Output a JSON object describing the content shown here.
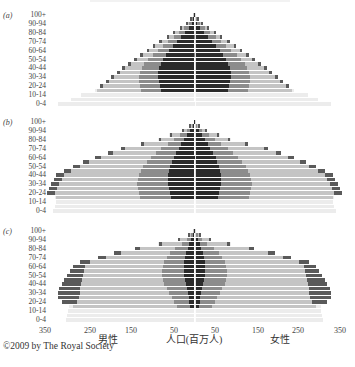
{
  "chart_data": {
    "type": "bar",
    "subtype": "population-pyramid",
    "title": "",
    "xlabel": "人口(百万人)",
    "left_label": "男性",
    "right_label": "女性",
    "x_ticks": [
      "350",
      "250",
      "150",
      "50",
      "50",
      "150",
      "250",
      "350"
    ],
    "x_tick_values": [
      -350,
      -250,
      -150,
      -50,
      50,
      150,
      250,
      350
    ],
    "xlim": [
      -350,
      350
    ],
    "age_tick_labels": [
      "100+",
      "90-94",
      "80-84",
      "70-74",
      "60-64",
      "50-54",
      "40-44",
      "30-34",
      "20-24",
      "10-14",
      "0-4"
    ],
    "age_groups": [
      "100+",
      "95-99",
      "90-94",
      "85-89",
      "80-84",
      "75-79",
      "70-74",
      "65-69",
      "60-64",
      "55-59",
      "50-54",
      "45-49",
      "40-44",
      "35-39",
      "30-34",
      "25-29",
      "20-24",
      "15-19",
      "10-14",
      "5-9",
      "0-4"
    ],
    "layers": [
      "darkest (innermost)",
      "mid gray",
      "light gray",
      "lightest",
      "dark outer cap"
    ],
    "layer_colors": [
      "#2b2b2b",
      "#8c8c8c",
      "#c4c4c4",
      "#ececec",
      "#5a5a5a"
    ],
    "units": "millions",
    "grid": false,
    "legend": "none",
    "panels": [
      {
        "label": "(a)",
        "rows": [
          {
            "age": "100+",
            "l": [
              1,
              2,
              3,
              3
            ],
            "cap": 0
          },
          {
            "age": "95-99",
            "l": [
              3,
              6,
              9,
              9
            ],
            "cap": 1
          },
          {
            "age": "90-94",
            "l": [
              7,
              13,
              19,
              20
            ],
            "cap": 3
          },
          {
            "age": "85-89",
            "l": [
              14,
              24,
              33,
              35
            ],
            "cap": 4
          },
          {
            "age": "80-84",
            "l": [
              22,
              36,
              48,
              50
            ],
            "cap": 5
          },
          {
            "age": "75-79",
            "l": [
              32,
              50,
              64,
              66
            ],
            "cap": 5
          },
          {
            "age": "70-74",
            "l": [
              42,
              64,
              80,
              82
            ],
            "cap": 6
          },
          {
            "age": "65-69",
            "l": [
              52,
              76,
              96,
              98
            ],
            "cap": 6
          },
          {
            "age": "60-64",
            "l": [
              60,
              88,
              110,
              112
            ],
            "cap": 6
          },
          {
            "age": "55-59",
            "l": [
              68,
              100,
              124,
              126
            ],
            "cap": 7
          },
          {
            "age": "50-54",
            "l": [
              76,
              110,
              140,
              142
            ],
            "cap": 7
          },
          {
            "age": "45-49",
            "l": [
              80,
              120,
              154,
              156
            ],
            "cap": 7
          },
          {
            "age": "40-44",
            "l": [
              84,
              126,
              168,
              170
            ],
            "cap": 8
          },
          {
            "age": "35-39",
            "l": [
              86,
              130,
              180,
              182
            ],
            "cap": 8
          },
          {
            "age": "30-34",
            "l": [
              86,
              132,
              194,
              196
            ],
            "cap": 8
          },
          {
            "age": "25-29",
            "l": [
              84,
              132,
              206,
              208
            ],
            "cap": 8
          },
          {
            "age": "20-24",
            "l": [
              82,
              130,
              220,
              222
            ],
            "cap": 8
          },
          {
            "age": "15-19",
            "l": [
              80,
              128,
              232,
              236
            ],
            "cap": 0
          },
          {
            "age": "10-14",
            "l": [
              0,
              0,
              0,
              270
            ],
            "cap": 0
          },
          {
            "age": "5-9",
            "l": [
              0,
              0,
              0,
              295
            ],
            "cap": 0
          },
          {
            "age": "0-4",
            "l": [
              0,
              0,
              0,
              325
            ],
            "cap": 0
          }
        ]
      },
      {
        "label": "(b)",
        "rows": [
          {
            "age": "100+",
            "l": [
              1,
              1,
              2,
              2
            ],
            "cap": 0
          },
          {
            "age": "95-99",
            "l": [
              4,
              7,
              10,
              10
            ],
            "cap": 1
          },
          {
            "age": "90-94",
            "l": [
              10,
              18,
              28,
              30
            ],
            "cap": 3
          },
          {
            "age": "85-89",
            "l": [
              18,
              34,
              56,
              60
            ],
            "cap": 5
          },
          {
            "age": "80-84",
            "l": [
              26,
              48,
              82,
              88
            ],
            "cap": 6
          },
          {
            "age": "75-79",
            "l": [
              32,
              64,
              122,
              128
            ],
            "cap": 8
          },
          {
            "age": "70-74",
            "l": [
              38,
              80,
              168,
              176
            ],
            "cap": 10
          },
          {
            "age": "65-69",
            "l": [
              44,
              92,
              196,
              204
            ],
            "cap": 12
          },
          {
            "age": "60-64",
            "l": [
              50,
              104,
              226,
              234
            ],
            "cap": 14
          },
          {
            "age": "55-59",
            "l": [
              54,
              114,
              254,
              262
            ],
            "cap": 15
          },
          {
            "age": "50-54",
            "l": [
              58,
              122,
              276,
              284
            ],
            "cap": 16
          },
          {
            "age": "45-49",
            "l": [
              60,
              128,
              296,
              304
            ],
            "cap": 18
          },
          {
            "age": "40-44",
            "l": [
              62,
              132,
              312,
              318
            ],
            "cap": 20
          },
          {
            "age": "35-39",
            "l": [
              62,
              134,
              318,
              324
            ],
            "cap": 20
          },
          {
            "age": "30-34",
            "l": [
              62,
              136,
              324,
              330
            ],
            "cap": 20
          },
          {
            "age": "25-29",
            "l": [
              60,
              134,
              330,
              334
            ],
            "cap": 18
          },
          {
            "age": "20-24",
            "l": [
              58,
              132,
              334,
              338
            ],
            "cap": 20
          },
          {
            "age": "15-19",
            "l": [
              56,
              130,
              330,
              332
            ],
            "cap": 0
          },
          {
            "age": "10-14",
            "l": [
              0,
              0,
              0,
              330
            ],
            "cap": 0
          },
          {
            "age": "5-9",
            "l": [
              0,
              0,
              0,
              332
            ],
            "cap": 0
          },
          {
            "age": "0-4",
            "l": [
              0,
              0,
              0,
              338
            ],
            "cap": 0
          }
        ]
      },
      {
        "label": "(c)",
        "rows": [
          {
            "age": "100+",
            "l": [
              1,
              2,
              3,
              3
            ],
            "cap": 0
          },
          {
            "age": "95-99",
            "l": [
              4,
              8,
              14,
              14
            ],
            "cap": 2
          },
          {
            "age": "90-94",
            "l": [
              8,
              18,
              36,
              40
            ],
            "cap": 5
          },
          {
            "age": "85-89",
            "l": [
              12,
              30,
              80,
              86
            ],
            "cap": 8
          },
          {
            "age": "80-84",
            "l": [
              16,
              46,
              132,
              140
            ],
            "cap": 12
          },
          {
            "age": "75-79",
            "l": [
              20,
              58,
              178,
              188
            ],
            "cap": 16
          },
          {
            "age": "70-74",
            "l": [
              22,
              66,
              214,
              224
            ],
            "cap": 18
          },
          {
            "age": "65-69",
            "l": [
              24,
              72,
              252,
              262
            ],
            "cap": 22
          },
          {
            "age": "60-64",
            "l": [
              26,
              76,
              262,
              272
            ],
            "cap": 30
          },
          {
            "age": "55-59",
            "l": [
              26,
              78,
              266,
              276
            ],
            "cap": 34
          },
          {
            "age": "50-54",
            "l": [
              24,
              78,
              268,
              278
            ],
            "cap": 38
          },
          {
            "age": "45-49",
            "l": [
              22,
              76,
              270,
              280
            ],
            "cap": 42
          },
          {
            "age": "40-44",
            "l": [
              20,
              72,
              272,
              282
            ],
            "cap": 46
          },
          {
            "age": "35-39",
            "l": [
              18,
              66,
              274,
              284
            ],
            "cap": 50
          },
          {
            "age": "30-34",
            "l": [
              16,
              60,
              276,
              286
            ],
            "cap": 52
          },
          {
            "age": "25-29",
            "l": [
              14,
              54,
              278,
              288
            ],
            "cap": 50
          },
          {
            "age": "20-24",
            "l": [
              12,
              48,
              282,
              292
            ],
            "cap": 36
          },
          {
            "age": "15-19",
            "l": [
              10,
              42,
              290,
              300
            ],
            "cap": 0
          },
          {
            "age": "10-14",
            "l": [
              0,
              0,
              0,
              302
            ],
            "cap": 0
          },
          {
            "age": "5-9",
            "l": [
              0,
              0,
              0,
              304
            ],
            "cap": 0
          },
          {
            "age": "0-4",
            "l": [
              0,
              0,
              0,
              306
            ],
            "cap": 0
          }
        ]
      }
    ]
  },
  "axis": {
    "ticks": [
      "350",
      "250",
      "150",
      "50",
      "50",
      "150",
      "250",
      "350"
    ],
    "male_label": "男性",
    "center_label": "人口(百万人)",
    "female_label": "女性"
  },
  "panels": [
    {
      "label": "(a)",
      "ages": [
        "100+",
        "90-94",
        "80-84",
        "70-74",
        "60-64",
        "50-54",
        "40-44",
        "30-34",
        "20-24",
        "10-14",
        "0-4"
      ]
    },
    {
      "label": "(b)",
      "ages": [
        "100+",
        "90-94",
        "80-84",
        "70-74",
        "60-64",
        "50-54",
        "40-44",
        "30-34",
        "20-24",
        "10-14",
        "0-4"
      ]
    },
    {
      "label": "(c)",
      "ages": [
        "100+",
        "90-94",
        "80-84",
        "70-74",
        "60-64",
        "50-54",
        "40-44",
        "30-34",
        "20-24",
        "10-14",
        "0-4"
      ]
    }
  ],
  "copyright": "©2009 by The Royal Society"
}
